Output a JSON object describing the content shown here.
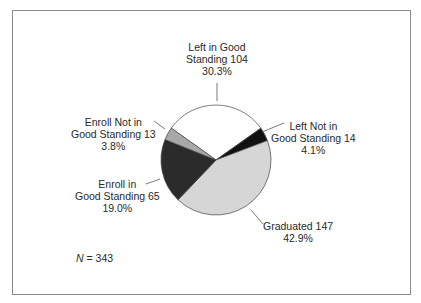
{
  "chart_data": {
    "type": "pie",
    "title": "",
    "total_label": "N",
    "total": 343,
    "slices": [
      {
        "label": "Left in Good Standing",
        "value": 104,
        "percent": 30.3,
        "color": "#ffffff"
      },
      {
        "label": "Left Not in Good Standing",
        "value": 14,
        "percent": 4.1,
        "color": "#111111"
      },
      {
        "label": "Graduated",
        "value": 147,
        "percent": 42.9,
        "color": "#d6d6d6"
      },
      {
        "label": "Enroll in Good Standing",
        "value": 65,
        "percent": 19.0,
        "color": "#2b2b2b"
      },
      {
        "label": "Enroll Not in Good Standing",
        "value": 13,
        "percent": 3.8,
        "color": "#a8a8a8"
      }
    ],
    "start_angle_deg": 305.5,
    "direction": "clockwise"
  },
  "labels": {
    "left_good": {
      "line1": "Left in Good",
      "line2": "Standing 104",
      "line3": "30.3%"
    },
    "left_not_good": {
      "line1": "Left Not in",
      "line2": "Good Standing 14",
      "line3": "4.1%"
    },
    "graduated": {
      "line1": "Graduated 147",
      "line2": "42.9%"
    },
    "enroll_good": {
      "line1": "Enroll in",
      "line2": "Good Standing 65",
      "line3": "19.0%"
    },
    "enroll_not_good": {
      "line1": "Enroll Not in",
      "line2": "Good Standing 13",
      "line3": "3.8%"
    }
  },
  "footer": {
    "n_symbol": "N",
    "n_text": " = 343"
  }
}
